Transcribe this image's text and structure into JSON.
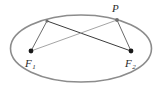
{
  "figure": {
    "type": "geometry-diagram",
    "width": 159,
    "height": 95,
    "background_color": "#ffffff",
    "ellipse": {
      "name": "ellipse-outline",
      "center_x": 81,
      "center_y": 48.5,
      "radius_x": 70.5,
      "radius_y": 33.5,
      "stroke_color": "#8c8c8c",
      "stroke_width": 1.6,
      "fill": "none"
    },
    "points": [
      {
        "id": "P",
        "label": "P",
        "x": 117,
        "y": 20,
        "on_ellipse": true,
        "marker": "dot",
        "marker_radius": 1.9,
        "marker_color": "#6f6f6f"
      },
      {
        "id": "Q",
        "label": "",
        "x": 47,
        "y": 21,
        "on_ellipse": true,
        "marker": "dot",
        "marker_radius": 1.6,
        "marker_color": "#6f6f6f"
      },
      {
        "id": "F1",
        "label": "F",
        "subscript": "1",
        "x": 31,
        "y": 51,
        "on_ellipse": false,
        "marker": "dot",
        "marker_radius": 2.4,
        "marker_color": "#1a1a1a"
      },
      {
        "id": "F2",
        "label": "F",
        "subscript": "2",
        "x": 131,
        "y": 51,
        "on_ellipse": false,
        "marker": "dot",
        "marker_radius": 2.4,
        "marker_color": "#1a1a1a"
      }
    ],
    "segments": [
      {
        "id": "seg-Q-F1",
        "from": "Q",
        "to": "F1",
        "x1": 47,
        "y1": 21,
        "x2": 31,
        "y2": 51,
        "stroke_color": "#5a5a5a",
        "stroke_width": 0.9
      },
      {
        "id": "seg-Q-F2",
        "from": "Q",
        "to": "F2",
        "x1": 47,
        "y1": 21,
        "x2": 131,
        "y2": 51,
        "stroke_color": "#3b3b3b",
        "stroke_width": 1.0
      },
      {
        "id": "seg-P-F1",
        "from": "P",
        "to": "F1",
        "x1": 117,
        "y1": 20,
        "x2": 31,
        "y2": 51,
        "stroke_color": "#9a9a9a",
        "stroke_width": 0.9
      },
      {
        "id": "seg-P-F2",
        "from": "P",
        "to": "F2",
        "x1": 117,
        "y1": 20,
        "x2": 131,
        "y2": 51,
        "stroke_color": "#5a5a5a",
        "stroke_width": 0.9
      }
    ],
    "labels": {
      "p": "P",
      "f": "F",
      "f1_sub": "1",
      "f2_sub": "2"
    }
  }
}
